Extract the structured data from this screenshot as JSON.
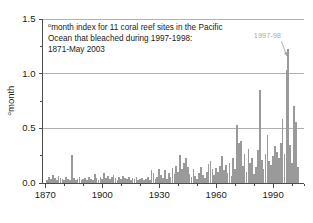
{
  "figure": {
    "background_color": "#ffffff",
    "bar_color": "#9a9a9a",
    "axis_color": "#4d4d4d",
    "grid_color": "#b0b0b0",
    "annotation_color": "#a8a8a8"
  },
  "chart_data": {
    "type": "bar",
    "title_lines": [
      "month index for 11 coral reef sites in the Pacific",
      "Ocean that bleached during 1997-1998:",
      "1871-May 2003"
    ],
    "title_superscript": "o",
    "xlabel": "",
    "ylabel": "°month",
    "ylabel_superscript": "o",
    "ylabel_body": "month",
    "xlim": [
      1871,
      2003
    ],
    "ylim": [
      0.0,
      1.5
    ],
    "grid": true,
    "grid_y": [
      0.5,
      1.0,
      1.5
    ],
    "legend": "none",
    "xticks": [
      1870,
      1900,
      1930,
      1960,
      1990
    ],
    "xtick_labels": [
      "1870",
      "1900",
      "1930",
      "1960",
      "1990"
    ],
    "xminor_step": 10,
    "yticks": [
      0.0,
      0.5,
      1.0,
      1.5
    ],
    "ytick_labels": [
      "0.0",
      "0.5",
      "1.0",
      "1.5"
    ],
    "yminor_step": 0.25,
    "annotations": [
      {
        "text": "1997-98",
        "x_year": 1998,
        "y_value": 1.22,
        "label_x_year": 1987,
        "label_y_value": 1.32,
        "arrow": true
      }
    ],
    "x": [
      1871,
      1872,
      1873,
      1874,
      1875,
      1876,
      1877,
      1878,
      1879,
      1880,
      1881,
      1882,
      1883,
      1884,
      1885,
      1886,
      1887,
      1888,
      1889,
      1890,
      1891,
      1892,
      1893,
      1894,
      1895,
      1896,
      1897,
      1898,
      1899,
      1900,
      1901,
      1902,
      1903,
      1904,
      1905,
      1906,
      1907,
      1908,
      1909,
      1910,
      1911,
      1912,
      1913,
      1914,
      1915,
      1916,
      1917,
      1918,
      1919,
      1920,
      1921,
      1922,
      1923,
      1924,
      1925,
      1926,
      1927,
      1928,
      1929,
      1930,
      1931,
      1932,
      1933,
      1934,
      1935,
      1936,
      1937,
      1938,
      1939,
      1940,
      1941,
      1942,
      1943,
      1944,
      1945,
      1946,
      1947,
      1948,
      1949,
      1950,
      1951,
      1952,
      1953,
      1954,
      1955,
      1956,
      1957,
      1958,
      1959,
      1960,
      1961,
      1962,
      1963,
      1964,
      1965,
      1966,
      1967,
      1968,
      1969,
      1970,
      1971,
      1972,
      1973,
      1974,
      1975,
      1976,
      1977,
      1978,
      1979,
      1980,
      1981,
      1982,
      1983,
      1984,
      1985,
      1986,
      1987,
      1988,
      1989,
      1990,
      1991,
      1992,
      1993,
      1994,
      1995,
      1996,
      1997,
      1998,
      1999,
      2000,
      2001,
      2002,
      2003
    ],
    "values": [
      0.02,
      0.05,
      0.03,
      0.07,
      0.04,
      0.02,
      0.06,
      0.04,
      0.03,
      0.02,
      0.05,
      0.03,
      0.02,
      0.25,
      0.04,
      0.02,
      0.03,
      0.05,
      0.02,
      0.03,
      0.04,
      0.02,
      0.05,
      0.03,
      0.02,
      0.08,
      0.04,
      0.02,
      0.05,
      0.03,
      0.09,
      0.04,
      0.06,
      0.03,
      0.05,
      0.07,
      0.04,
      0.02,
      0.05,
      0.03,
      0.06,
      0.04,
      0.03,
      0.05,
      0.02,
      0.04,
      0.03,
      0.05,
      0.02,
      0.03,
      0.04,
      0.02,
      0.03,
      0.05,
      0.02,
      0.11,
      0.09,
      0.03,
      0.05,
      0.12,
      0.07,
      0.04,
      0.11,
      0.03,
      0.09,
      0.05,
      0.13,
      0.08,
      0.15,
      0.1,
      0.25,
      0.12,
      0.18,
      0.22,
      0.14,
      0.08,
      0.05,
      0.12,
      0.06,
      0.03,
      0.09,
      0.14,
      0.07,
      0.04,
      0.1,
      0.17,
      0.2,
      0.12,
      0.07,
      0.13,
      0.1,
      0.15,
      0.24,
      0.11,
      0.16,
      0.09,
      0.18,
      0.06,
      0.22,
      0.12,
      0.53,
      0.36,
      0.38,
      0.15,
      0.26,
      0.1,
      0.31,
      0.18,
      0.22,
      0.08,
      0.14,
      0.3,
      0.85,
      0.21,
      0.12,
      0.26,
      0.43,
      0.2,
      0.16,
      0.24,
      0.33,
      0.28,
      0.22,
      0.36,
      0.58,
      0.26,
      1.03,
      1.22,
      0.34,
      0.18,
      0.7,
      0.55,
      0.14
    ]
  }
}
